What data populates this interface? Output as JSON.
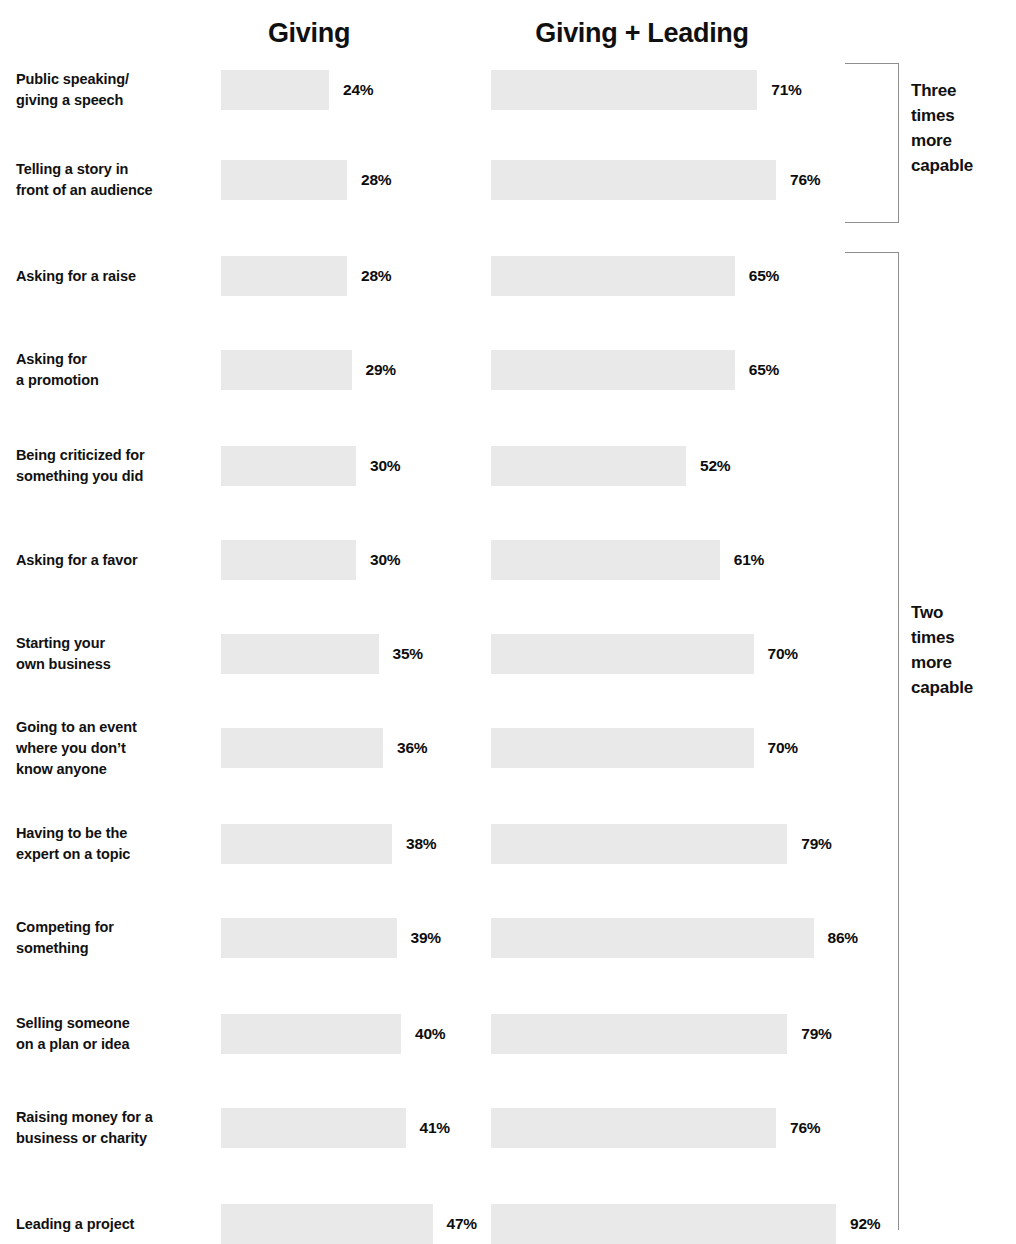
{
  "chart_data": {
    "type": "bar",
    "title": "",
    "subtitle": "",
    "xlabel": "",
    "ylabel": "",
    "grid": false,
    "legend_position": "top",
    "orientation": "horizontal",
    "value_suffix": "%",
    "xlim": [
      0,
      100
    ],
    "categories": [
      "Public speaking/\ngiving a speech",
      "Telling a story in\nfront of an audience",
      "Asking for a raise",
      "Asking for\na promotion",
      "Being criticized for\nsomething you did",
      "Asking for a favor",
      "Starting your\nown business",
      "Going to an event\nwhere you don’t\nknow anyone",
      "Having to be the\nexpert on a topic",
      "Competing for\nsomething",
      "Selling someone\non a plan or idea",
      "Raising money for a\nbusiness or charity",
      "Leading a project"
    ],
    "series": [
      {
        "name": "Giving",
        "values": [
          24,
          28,
          28,
          29,
          30,
          30,
          35,
          36,
          38,
          39,
          40,
          41,
          47
        ],
        "labels": [
          "24%",
          "28%",
          "28%",
          "29%",
          "30%",
          "30%",
          "35%",
          "36%",
          "38%",
          "39%",
          "40%",
          "41%",
          "47%"
        ]
      },
      {
        "name": "Giving + Leading",
        "values": [
          71,
          76,
          65,
          65,
          52,
          61,
          70,
          70,
          79,
          86,
          79,
          76,
          92
        ],
        "labels": [
          "71%",
          "76%",
          "65%",
          "65%",
          "52%",
          "61%",
          "70%",
          "70%",
          "79%",
          "86%",
          "79%",
          "76%",
          "92%"
        ]
      }
    ],
    "annotations": [
      {
        "text": "Three\ntimes\nmore\ncapable",
        "rows": [
          0,
          1
        ]
      },
      {
        "text": "Two\ntimes\nmore\ncapable",
        "rows": [
          2,
          12
        ]
      }
    ],
    "bar_color": "#e9e9e9",
    "text_color": "#101010",
    "bracket_color": "#8e8e8e"
  },
  "headers": {
    "giving": "Giving",
    "giving_leading": "Giving + Leading"
  },
  "rows": [
    {
      "label": "Public speaking/\ngiving a speech",
      "left": "24%",
      "right": "71%"
    },
    {
      "label": "Telling a story in\nfront of an audience",
      "left": "28%",
      "right": "76%"
    },
    {
      "label": "Asking for a raise",
      "left": "28%",
      "right": "65%"
    },
    {
      "label": "Asking for\na promotion",
      "left": "29%",
      "right": "65%"
    },
    {
      "label": "Being criticized for\nsomething you did",
      "left": "30%",
      "right": "52%"
    },
    {
      "label": "Asking for a favor",
      "left": "30%",
      "right": "61%"
    },
    {
      "label": "Starting your\nown business",
      "left": "35%",
      "right": "70%"
    },
    {
      "label": "Going to an event\nwhere you don’t\nknow anyone",
      "left": "36%",
      "right": "70%"
    },
    {
      "label": "Having to be the\nexpert on a topic",
      "left": "38%",
      "right": "79%"
    },
    {
      "label": "Competing for\nsomething",
      "left": "39%",
      "right": "86%"
    },
    {
      "label": "Selling someone\non a plan or idea",
      "left": "40%",
      "right": "79%"
    },
    {
      "label": "Raising money for a\nbusiness or charity",
      "left": "41%",
      "right": "76%"
    },
    {
      "label": "Leading a project",
      "left": "47%",
      "right": "92%"
    }
  ],
  "brackets": [
    {
      "label": "Three\ntimes\nmore\ncapable"
    },
    {
      "label": "Two\ntimes\nmore\ncapable"
    }
  ]
}
